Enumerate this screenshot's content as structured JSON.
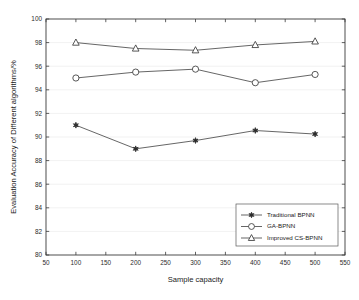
{
  "chart_data": {
    "type": "line",
    "title": "",
    "xlabel": "Sample capacity",
    "ylabel": "Evaluation Accuracy of Different algorithms/%",
    "x": [
      100,
      200,
      300,
      400,
      500
    ],
    "xlim": [
      50,
      550
    ],
    "ylim": [
      80,
      100
    ],
    "xticks": [
      50,
      100,
      150,
      200,
      250,
      300,
      350,
      400,
      450,
      500,
      550
    ],
    "yticks": [
      80,
      82,
      84,
      86,
      88,
      90,
      92,
      94,
      96,
      98,
      100
    ],
    "grid": true,
    "legend_position": "lower right",
    "series": [
      {
        "name": "Traditional BPNN",
        "marker": "star-filled",
        "values": [
          91.0,
          89.0,
          89.7,
          90.55,
          90.25
        ]
      },
      {
        "name": "GA-BPNN",
        "marker": "circle-open",
        "values": [
          95.0,
          95.5,
          95.75,
          94.6,
          95.3
        ]
      },
      {
        "name": "Improved CS-BPNN",
        "marker": "triangle-open",
        "values": [
          98.0,
          97.5,
          97.35,
          97.8,
          98.1
        ]
      }
    ]
  },
  "colors": {
    "line": "#4a4a4a",
    "axis": "#3a3a3a",
    "grid": "#e8e8e8",
    "marker_fill": "#ffffff",
    "marker_filled": "#2b2b2b",
    "background": "#ffffff"
  }
}
